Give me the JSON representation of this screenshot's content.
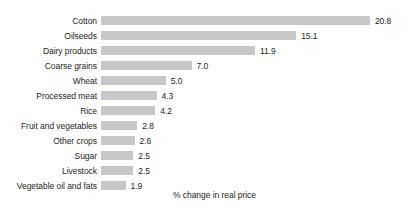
{
  "chart_data": {
    "type": "bar",
    "orientation": "horizontal",
    "title": "",
    "subtitle": "",
    "xlabel": "% change in real price",
    "ylabel": "",
    "grid": false,
    "legend": null,
    "xlim": [
      0,
      20.8
    ],
    "categories": [
      "Cotton",
      "Oilseeds",
      "Dairy products",
      "Coarse grains",
      "Wheat",
      "Processed meat",
      "Rice",
      "Fruit and vegetables",
      "Other crops",
      "Sugar",
      "Livestock",
      "Vegetable oil and fats"
    ],
    "values": [
      20.8,
      15.1,
      11.9,
      7.0,
      5.0,
      4.3,
      4.2,
      2.8,
      2.6,
      2.5,
      2.5,
      1.9
    ],
    "value_labels": [
      "20.8",
      "15.1",
      "11.9",
      "7.0",
      "5.0",
      "4.3",
      "4.2",
      "2.8",
      "2.6",
      "2.5",
      "2.5",
      "1.9"
    ],
    "bar_color": "#c8c8c8",
    "text_color": "#231f20",
    "background_color": "#ffffff"
  }
}
